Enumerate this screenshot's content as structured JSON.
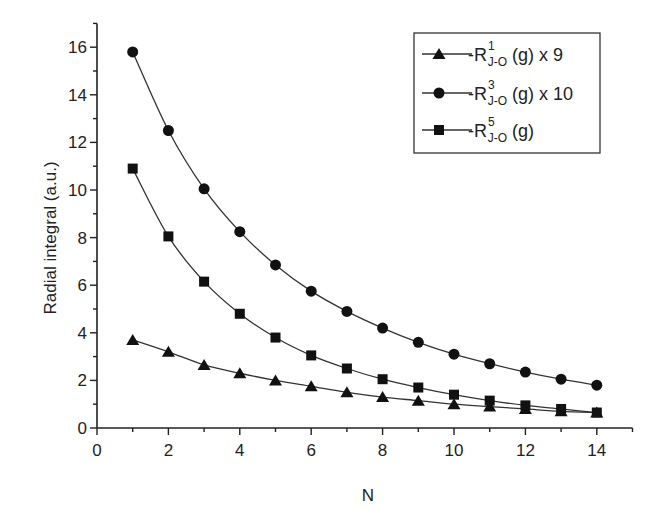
{
  "chart_data": {
    "type": "line",
    "title": "",
    "xlabel": "N",
    "ylabel": "Radial integral (a.u.)",
    "xlim": [
      0,
      15
    ],
    "ylim": [
      0,
      17
    ],
    "xticks": [
      0,
      2,
      4,
      6,
      8,
      10,
      12,
      14
    ],
    "yticks": [
      0,
      2,
      4,
      6,
      8,
      10,
      12,
      14,
      16
    ],
    "grid": false,
    "legend_position": "upper right",
    "x": [
      1,
      2,
      3,
      4,
      5,
      6,
      7,
      8,
      9,
      10,
      11,
      12,
      13,
      14
    ],
    "series": [
      {
        "name": "-R^1_{J-O} (g) x 9",
        "marker": "triangle",
        "values": [
          3.7,
          3.2,
          2.65,
          2.3,
          2.0,
          1.75,
          1.5,
          1.3,
          1.15,
          1.0,
          0.9,
          0.8,
          0.7,
          0.65
        ]
      },
      {
        "name": "-R^3_{J-O} (g) x 10",
        "marker": "circle",
        "values": [
          15.8,
          12.5,
          10.05,
          8.25,
          6.85,
          5.75,
          4.9,
          4.2,
          3.6,
          3.1,
          2.7,
          2.35,
          2.05,
          1.8
        ]
      },
      {
        "name": "-R^5_{J-O} (g)",
        "marker": "square",
        "values": [
          10.9,
          8.05,
          6.15,
          4.8,
          3.8,
          3.05,
          2.5,
          2.05,
          1.7,
          1.4,
          1.15,
          0.95,
          0.8,
          0.65
        ]
      }
    ]
  },
  "legend": {
    "items": [
      {
        "prefix": "-R",
        "sup": "1",
        "sub": "J-O",
        "suffix": " (g) x 9"
      },
      {
        "prefix": "-R",
        "sup": "3",
        "sub": "J-O",
        "suffix": " (g) x 10"
      },
      {
        "prefix": "-R",
        "sup": "5",
        "sub": "J-O",
        "suffix": " (g)"
      }
    ]
  },
  "axes": {
    "xlabel": "N",
    "ylabel": "Radial integral (a.u.)"
  }
}
